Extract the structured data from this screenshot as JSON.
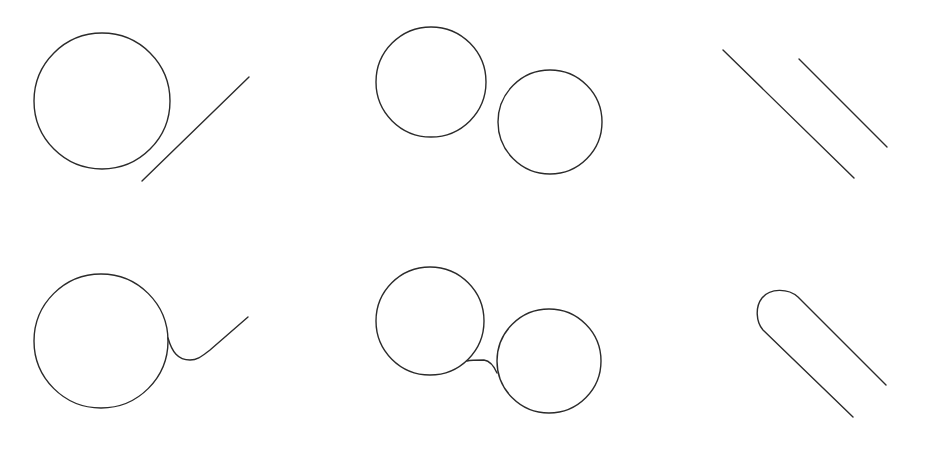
{
  "diagram": {
    "stroke_color": "#2b2b2b",
    "background": "#ffffff",
    "panels": [
      {
        "id": "circle-line-before",
        "row": "before",
        "circles": [
          {
            "cx": 102,
            "cy": 101,
            "r": 68
          }
        ],
        "lines": [
          {
            "x1": 142,
            "y1": 181,
            "x2": 249,
            "y2": 77
          }
        ]
      },
      {
        "id": "two-circles-before",
        "row": "before",
        "circles": [
          {
            "cx": 431,
            "cy": 82,
            "r": 55
          },
          {
            "cx": 550,
            "cy": 122,
            "r": 52
          }
        ]
      },
      {
        "id": "two-lines-before",
        "row": "before",
        "lines": [
          {
            "x1": 723,
            "y1": 50,
            "x2": 854,
            "y2": 178
          },
          {
            "x1": 799,
            "y1": 59,
            "x2": 887,
            "y2": 147
          }
        ]
      },
      {
        "id": "circle-line-after",
        "row": "after",
        "circles": [
          {
            "cx": 101,
            "cy": 341,
            "r": 67
          }
        ],
        "path": "M168,338 C172,352 178,360 190,360 C198,360 202,356 210,350 L248,317"
      },
      {
        "id": "two-circles-after",
        "row": "after",
        "circles": [
          {
            "cx": 430,
            "cy": 321,
            "r": 54
          },
          {
            "cx": 549,
            "cy": 361,
            "r": 52
          }
        ],
        "path": "M467,361 C471,360 475,360 484,360 C490,361 494,366 497,373"
      },
      {
        "id": "two-lines-after",
        "row": "after",
        "path": "M886,385 L798,297 C788,288 770,288 762,298 C755,307 756,322 763,330 L853,417"
      }
    ]
  }
}
